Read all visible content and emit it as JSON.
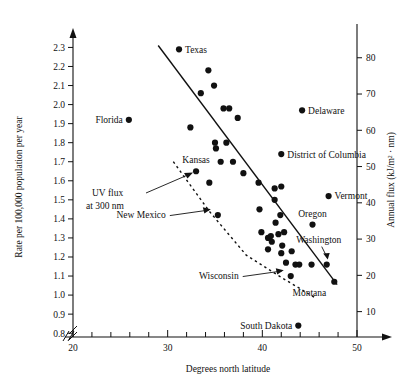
{
  "chart_data": {
    "type": "scatter",
    "title": "",
    "xlabel": "Degrees north latitude",
    "ylabel": "Rate per 100,000 population per year",
    "y2label": "Annual flux (kJ/m² · nm)",
    "xlim": [
      20,
      50
    ],
    "ylim": [
      0.78,
      2.36
    ],
    "y2lim": [
      3,
      86
    ],
    "grid": false,
    "legend": null,
    "axis_break_x": true,
    "axis_break_y": true,
    "xticks_major": [
      20,
      30,
      40,
      50
    ],
    "xticks_major_labels": [
      "20",
      "30",
      "40",
      "50"
    ],
    "xticks_minor": [
      22,
      24,
      26,
      28,
      32,
      34,
      36,
      38,
      42,
      44,
      46,
      48
    ],
    "yticks": [
      0.8,
      0.9,
      1.0,
      1.1,
      1.2,
      1.3,
      1.4,
      1.5,
      1.6,
      1.7,
      1.8,
      1.9,
      2.0,
      2.1,
      2.2,
      2.3
    ],
    "ytick_labels": [
      "0.8",
      "0.9",
      "1.0",
      "1.1",
      "1.2",
      "1.3",
      "1.4",
      "1.5",
      "1.6",
      "1.7",
      "1.8",
      "1.9",
      "2.0",
      "2.1",
      "2.2",
      "2.3"
    ],
    "y2ticks": [
      10,
      20,
      30,
      40,
      50,
      60,
      70,
      80
    ],
    "y2tick_labels": [
      "10",
      "20",
      "30",
      "40",
      "50",
      "60",
      "70",
      "80"
    ],
    "points": [
      {
        "x": 25.9,
        "y": 1.92,
        "label": "Florida",
        "label_side": "left"
      },
      {
        "x": 31.2,
        "y": 2.29,
        "label": "Texas",
        "label_side": "right"
      },
      {
        "x": 34.3,
        "y": 2.18,
        "label": "",
        "label_side": ""
      },
      {
        "x": 34.9,
        "y": 2.1,
        "label": "",
        "label_side": ""
      },
      {
        "x": 33.5,
        "y": 2.06,
        "label": "",
        "label_side": ""
      },
      {
        "x": 35.9,
        "y": 1.98,
        "label": "",
        "label_side": ""
      },
      {
        "x": 36.5,
        "y": 1.98,
        "label": "",
        "label_side": ""
      },
      {
        "x": 32.4,
        "y": 1.88,
        "label": "",
        "label_side": ""
      },
      {
        "x": 37.4,
        "y": 1.93,
        "label": "",
        "label_side": ""
      },
      {
        "x": 35.0,
        "y": 1.8,
        "label": "",
        "label_side": ""
      },
      {
        "x": 35.1,
        "y": 1.77,
        "label": "",
        "label_side": ""
      },
      {
        "x": 36.2,
        "y": 1.8,
        "label": "",
        "label_side": ""
      },
      {
        "x": 35.6,
        "y": 1.7,
        "label": "",
        "label_side": ""
      },
      {
        "x": 36.9,
        "y": 1.7,
        "label": "",
        "label_side": ""
      },
      {
        "x": 33.0,
        "y": 1.65,
        "label": "Kansas",
        "label_side": "above"
      },
      {
        "x": 38.0,
        "y": 1.64,
        "label": "",
        "label_side": ""
      },
      {
        "x": 42.0,
        "y": 1.74,
        "label": "District of Columbia",
        "label_side": "right"
      },
      {
        "x": 44.2,
        "y": 1.97,
        "label": "Delaware",
        "label_side": "right"
      },
      {
        "x": 34.4,
        "y": 1.59,
        "label": "",
        "label_side": ""
      },
      {
        "x": 39.6,
        "y": 1.59,
        "label": "",
        "label_side": ""
      },
      {
        "x": 41.3,
        "y": 1.56,
        "label": "",
        "label_side": ""
      },
      {
        "x": 42.0,
        "y": 1.57,
        "label": "",
        "label_side": ""
      },
      {
        "x": 41.3,
        "y": 1.5,
        "label": "",
        "label_side": ""
      },
      {
        "x": 47.0,
        "y": 1.52,
        "label": "Vermont",
        "label_side": "right"
      },
      {
        "x": 35.3,
        "y": 1.42,
        "label": "New Mexico",
        "label_side": "arrow-left"
      },
      {
        "x": 39.7,
        "y": 1.45,
        "label": "",
        "label_side": ""
      },
      {
        "x": 41.9,
        "y": 1.42,
        "label": "",
        "label_side": ""
      },
      {
        "x": 41.4,
        "y": 1.38,
        "label": "",
        "label_side": ""
      },
      {
        "x": 45.3,
        "y": 1.37,
        "label": "Oregon",
        "label_side": "above"
      },
      {
        "x": 39.9,
        "y": 1.33,
        "label": "",
        "label_side": ""
      },
      {
        "x": 40.6,
        "y": 1.3,
        "label": "",
        "label_side": ""
      },
      {
        "x": 40.9,
        "y": 1.31,
        "label": "",
        "label_side": ""
      },
      {
        "x": 41.0,
        "y": 1.28,
        "label": "",
        "label_side": ""
      },
      {
        "x": 41.7,
        "y": 1.32,
        "label": "",
        "label_side": ""
      },
      {
        "x": 42.3,
        "y": 1.33,
        "label": "",
        "label_side": ""
      },
      {
        "x": 40.6,
        "y": 1.24,
        "label": "",
        "label_side": ""
      },
      {
        "x": 42.1,
        "y": 1.26,
        "label": "",
        "label_side": ""
      },
      {
        "x": 42.0,
        "y": 1.22,
        "label": "",
        "label_side": ""
      },
      {
        "x": 43.1,
        "y": 1.23,
        "label": "",
        "label_side": ""
      },
      {
        "x": 42.5,
        "y": 1.17,
        "label": "",
        "label_side": ""
      },
      {
        "x": 43.5,
        "y": 1.16,
        "label": "",
        "label_side": ""
      },
      {
        "x": 43.9,
        "y": 1.16,
        "label": "",
        "label_side": ""
      },
      {
        "x": 45.2,
        "y": 1.16,
        "label": "",
        "label_side": ""
      },
      {
        "x": 46.8,
        "y": 1.16,
        "label": "Washington",
        "label_side": "arrow-above"
      },
      {
        "x": 43.0,
        "y": 1.1,
        "label": "Wisconsin",
        "label_side": "arrow-left"
      },
      {
        "x": 47.6,
        "y": 1.07,
        "label": "Montana",
        "label_side": "below-left"
      },
      {
        "x": 43.8,
        "y": 0.84,
        "label": "South Dakota",
        "label_side": "left"
      }
    ],
    "fit_line": {
      "x1": 29.0,
      "y1": 2.31,
      "x2": 47.9,
      "y2": 1.055,
      "style": "solid"
    },
    "uv_curve": {
      "label": "UV flux at 300 nm",
      "style": "dashed",
      "points": [
        [
          30.6,
          1.7
        ],
        [
          34.4,
          1.44
        ],
        [
          38.3,
          1.21
        ],
        [
          42.1,
          1.09
        ],
        [
          45.6,
          0.985
        ]
      ]
    },
    "annotations": [
      {
        "text": "UV flux",
        "x_px": 92,
        "y_px": 196
      },
      {
        "text": "at 300 nm",
        "x_px": 86,
        "y_px": 209
      }
    ]
  }
}
